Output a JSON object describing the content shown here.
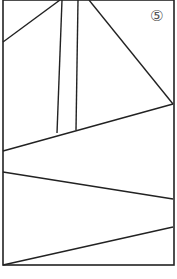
{
  "figure": {
    "label": "⑤",
    "label_pos": {
      "x": 150,
      "y": 9
    },
    "stroke_color": "#222222",
    "frame": {
      "x1": 3,
      "y1": 0,
      "x2": 174,
      "y2": 265
    },
    "lines": [
      {
        "x1": 3,
        "y1": 42,
        "x2": 60,
        "y2": 0
      },
      {
        "x1": 62,
        "y1": 0,
        "x2": 57,
        "y2": 133
      },
      {
        "x1": 78,
        "y1": 0,
        "x2": 76,
        "y2": 130
      },
      {
        "x1": 89,
        "y1": 0,
        "x2": 173,
        "y2": 104
      },
      {
        "x1": 3,
        "y1": 151,
        "x2": 173,
        "y2": 104
      },
      {
        "x1": 3,
        "y1": 172,
        "x2": 173,
        "y2": 199
      },
      {
        "x1": 3,
        "y1": 265,
        "x2": 173,
        "y2": 227
      }
    ]
  }
}
